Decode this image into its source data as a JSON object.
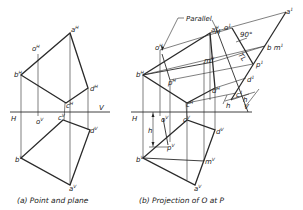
{
  "figure_a": {
    "caption": "(a) Point and plane",
    "fold_line": {
      "left_label": "H",
      "right_label": "V"
    },
    "labels": {
      "aH": "a",
      "oH": "o",
      "bH": "b",
      "dH": "d",
      "cH": "c",
      "oV": "o",
      "cV": "c",
      "dV": "d",
      "bV": "b",
      "aV": "a",
      "sup_H": "H",
      "sup_V": "V"
    }
  },
  "figure_b": {
    "caption": "(b) Projection of O at P",
    "annotation_parallel": "Parallel",
    "angle_label": "90°",
    "tl_label": "TL",
    "dimension_h": "h",
    "fold_line": {
      "left_label": "H",
      "right_label": "V"
    },
    "aux_fold_label": "H",
    "aux_fold_sub": "1",
    "labels": {
      "aH": "a",
      "oH": "o",
      "bH": "b",
      "mH": "m",
      "pH": "p",
      "dH": "d",
      "cH": "c",
      "oV": "o",
      "cV": "c",
      "dV": "d",
      "pV": "p",
      "bV": "b",
      "mV": "m",
      "aV": "a",
      "a1": "a",
      "o1": "o",
      "bm1": "b m",
      "p1": "p",
      "d1": "d",
      "c1": "c",
      "sup_H": "H",
      "sup_V": "V",
      "sup_1": "1"
    }
  }
}
